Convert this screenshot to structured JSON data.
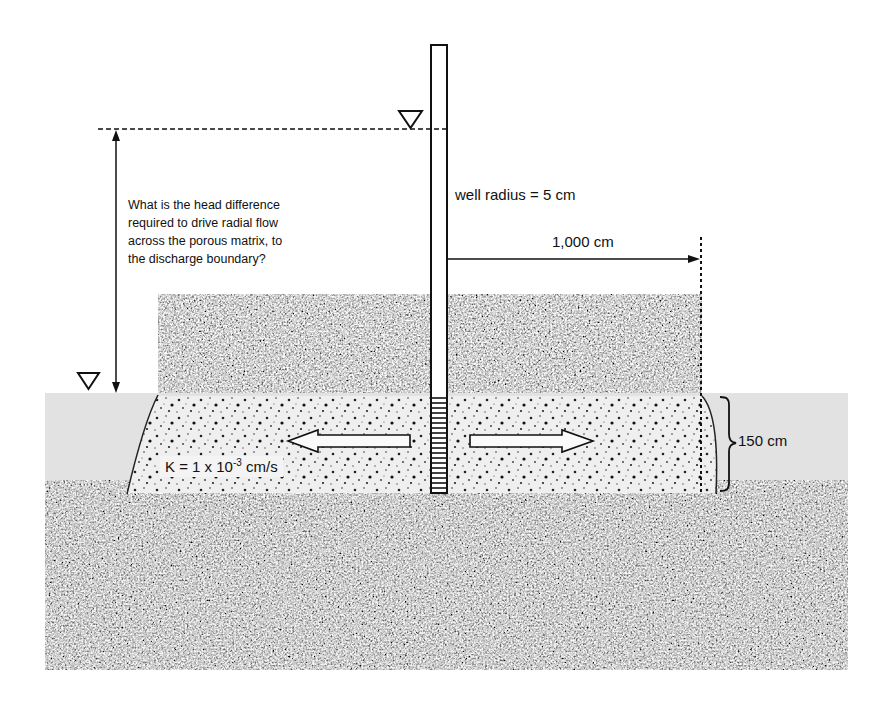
{
  "figure": {
    "question": {
      "lines": [
        "What is the head difference",
        "required to drive radial flow",
        "across the porous matrix, to",
        "the discharge boundary?"
      ]
    },
    "well_radius_label": "well radius = 5 cm",
    "radial_distance_label": "1,000 cm",
    "aquifer_thickness_label": "150 cm",
    "conductivity": {
      "prefix": "K = 1 x 10",
      "exponent": "-3",
      "suffix": " cm/s"
    },
    "symbols": {
      "upper_water_table": "water-table-triangle",
      "lower_water_table": "water-table-triangle"
    },
    "colors": {
      "background": "#ffffff",
      "water_band": "#e2e2e2",
      "aquifer_fill": "#efefef",
      "granite_dark": "#3a3a3a",
      "granite_light": "#b8b8b8",
      "line": "#111111"
    }
  }
}
